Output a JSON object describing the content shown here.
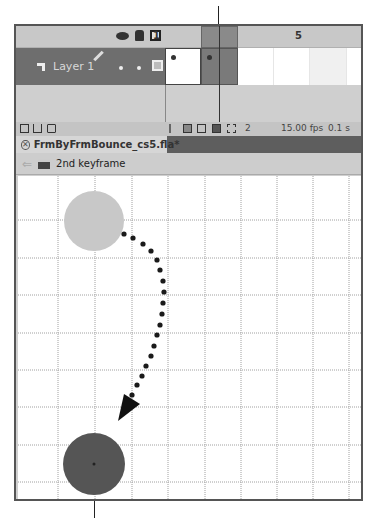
{
  "callouts": {
    "top_line_x": 218,
    "bottom_line_x": 94
  },
  "timeline": {
    "header_icons": [
      "eye-icon",
      "lock-icon",
      "outline-icon"
    ],
    "frame_numbers": [
      {
        "label": "1",
        "x": 151
      },
      {
        "label": "5",
        "x": 293
      }
    ],
    "layer": {
      "name": "Layer 1",
      "icon": "layer-icon",
      "edit_icon": "pencil-icon"
    },
    "current_frame": 2,
    "footer": {
      "left_icons": [
        "new-layer-icon",
        "new-folder-icon",
        "delete-icon"
      ],
      "onion_icons": [
        "center-frame-icon",
        "onion-skin-icon",
        "onion-skin-outline-icon",
        "edit-multiple-frames-icon",
        "modify-onion-markers-icon"
      ],
      "frame_label": "2",
      "fps_label": "15.00 fps",
      "time_label": "0.1 s"
    }
  },
  "document": {
    "tab_label": "FrmByFrmBounce_cs5.fla*",
    "close_symbol": "✕"
  },
  "editbar": {
    "back_symbol": "⇐",
    "scene_label": "2nd keyframe"
  },
  "stage": {
    "grid_color": "#9a9a9a",
    "onion_ball_color": "#c8c8c8",
    "ball_color": "#555555",
    "path_color": "#1a1a1a"
  }
}
